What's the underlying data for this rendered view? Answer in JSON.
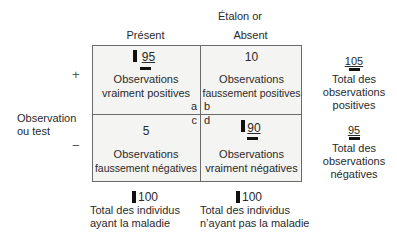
{
  "title": "Étalon or",
  "columns": {
    "present": "Présent",
    "absent": "Absent"
  },
  "row_label": {
    "line1": "Observation",
    "line2": "ou test"
  },
  "signs": {
    "positive": "+",
    "negative": "−"
  },
  "cells": {
    "a": {
      "value": "95",
      "desc_line1": "Observations",
      "desc_line2": "vraiment positives",
      "letter": "a"
    },
    "b": {
      "value": "10",
      "desc_line1": "Observations",
      "desc_line2": "faussement positives",
      "letter": "b"
    },
    "c": {
      "value": "5",
      "desc_line1": "Observations",
      "desc_line2": "faussement négatives",
      "letter": "c"
    },
    "d": {
      "value": "90",
      "desc_line1": "Observations",
      "desc_line2": "vraiment négatives",
      "letter": "d"
    }
  },
  "row_totals": {
    "positive": {
      "value": "105",
      "line1": "Total des",
      "line2": "observations",
      "line3": "positives"
    },
    "negative": {
      "value": "95",
      "line1": "Total des",
      "line2": "observations",
      "line3": "négatives"
    }
  },
  "column_totals": {
    "present": {
      "value": "100",
      "line1": "Total des individus",
      "line2": "ayant la maladie"
    },
    "absent": {
      "value": "100",
      "line1": "Total des individus",
      "line2": "n’ayant pas la maladie"
    }
  }
}
